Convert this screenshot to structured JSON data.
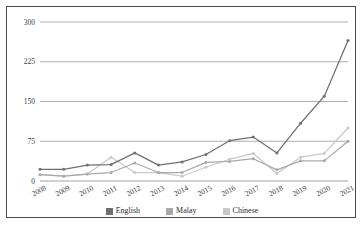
{
  "chart_data": {
    "type": "line",
    "title": "",
    "subtitle": "",
    "xlabel": "",
    "ylabel": "",
    "categories": [
      "2008",
      "2009",
      "2010",
      "2011",
      "2012",
      "2013",
      "2014",
      "2015",
      "2016",
      "2017",
      "2018",
      "2019",
      "2020",
      "2021"
    ],
    "x": [
      "2008",
      "2009",
      "2010",
      "2011",
      "2012",
      "2013",
      "2014",
      "2015",
      "2016",
      "2017",
      "2018",
      "2019",
      "2020",
      "2021"
    ],
    "series": [
      {
        "name": "English",
        "color": "#6f6f6f",
        "values": [
          22,
          22,
          30,
          31,
          53,
          30,
          36,
          50,
          76,
          83,
          53,
          109,
          160,
          265
        ]
      },
      {
        "name": "Malay",
        "color": "#a9a9a9",
        "values": [
          12,
          9,
          13,
          16,
          34,
          16,
          16,
          35,
          37,
          42,
          21,
          38,
          38,
          75
        ]
      },
      {
        "name": "Chinese",
        "color": "#c9c9c9",
        "values": [
          12,
          9,
          13,
          45,
          16,
          16,
          9,
          26,
          41,
          52,
          14,
          45,
          52,
          100
        ]
      }
    ],
    "ylim": [
      0,
      300
    ],
    "yticks": [
      0,
      75,
      150,
      225,
      300
    ],
    "ytick_labels": [
      "0",
      "75",
      "150",
      "225",
      "300"
    ],
    "xtick_labels": [
      "2008",
      "2009",
      "2010",
      "2011",
      "2012",
      "2013",
      "2014",
      "2015",
      "2016",
      "2017",
      "2018",
      "2019",
      "2020",
      "2021"
    ],
    "grid": true,
    "grid_axis": "y",
    "legend_position": "bottom",
    "legend": [
      "English",
      "Malay",
      "Chinese"
    ],
    "markers": true,
    "annotations": []
  },
  "legend": {
    "items": [
      {
        "label": "English",
        "color": "#6f6f6f"
      },
      {
        "label": "Malay",
        "color": "#a9a9a9"
      },
      {
        "label": "Chinese",
        "color": "#c9c9c9"
      }
    ]
  },
  "colors": {
    "english": "#6f6f6f",
    "malay": "#a9a9a9",
    "chinese": "#c9c9c9",
    "grid": "#8a8a8a",
    "frame": "#4a4a4a",
    "text": "#3d3d3d",
    "background": "#ffffff"
  }
}
